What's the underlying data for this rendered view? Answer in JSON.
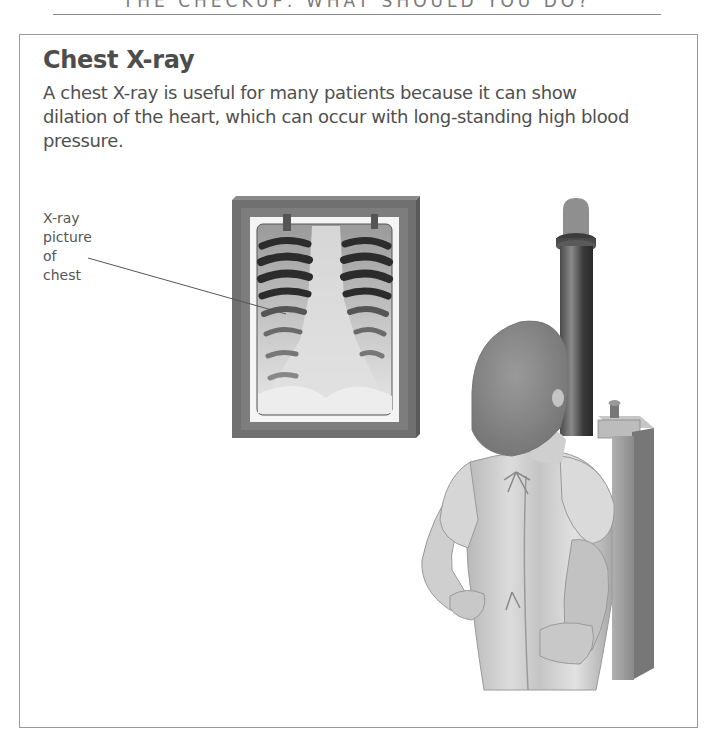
{
  "running_head": "THE CHECKUP: WHAT SHOULD YOU DO?",
  "section": {
    "title": "Chest X-ray",
    "body": "A chest X-ray is useful for many patients because it can show dilation of the heart, which can occur with long-standing high blood pressure."
  },
  "illustration": {
    "callout_label_lines": [
      "X-ray",
      "picture",
      "of",
      "chest"
    ],
    "subjects": [
      "chest-xray-film-on-lightbox",
      "patient-in-gown",
      "xray-machine-stand"
    ]
  },
  "colors": {
    "text": "#4d4d4d",
    "border": "#9a9a9a",
    "frame": "#6e6e6e"
  }
}
